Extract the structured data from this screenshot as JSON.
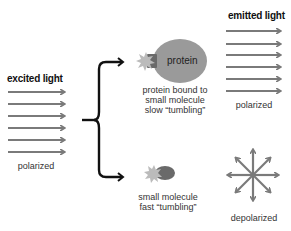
{
  "diagram": {
    "excited": {
      "title": "excited light",
      "caption": "polarized",
      "arrow_count": 6
    },
    "bound": {
      "protein_label": "protein",
      "caption_lines": [
        "protein bound to",
        "small molecule",
        "slow “tumbling”"
      ]
    },
    "free": {
      "caption_lines": [
        "small molecule",
        "fast “tumbling”"
      ]
    },
    "emitted": {
      "title": "emitted light",
      "caption_polarized": "polarized",
      "caption_depolarized": "depolarized",
      "arrow_count": 6
    },
    "colors": {
      "arrow": "#7a7a7a",
      "bracket": "#111111",
      "protein": "#9a9a9a",
      "molecule_body": "#6a6a6a",
      "star": "#b8b8b8"
    }
  }
}
